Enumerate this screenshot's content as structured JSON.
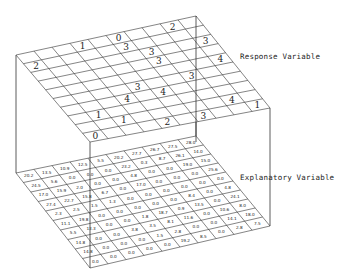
{
  "labels": {
    "response": "Response Variable",
    "explanatory": "Explanatory Variable"
  },
  "colors": {
    "line": "#333333",
    "text": "#222222",
    "background": "#ffffff"
  },
  "top_grid": {
    "rows": 10,
    "cols": 10,
    "cells": [
      {
        "r": 0,
        "c": 3,
        "v": "1"
      },
      {
        "r": 0,
        "c": 8,
        "v": "2"
      },
      {
        "r": 1,
        "c": 0,
        "v": "2"
      },
      {
        "r": 0,
        "c": 5,
        "v": "0"
      },
      {
        "r": 1,
        "c": 5,
        "v": "3"
      },
      {
        "r": 2,
        "c": 6,
        "v": "3"
      },
      {
        "r": 3,
        "c": 6,
        "v": "3"
      },
      {
        "r": 2,
        "c": 9,
        "v": "3"
      },
      {
        "r": 4,
        "c": 9,
        "v": "4"
      },
      {
        "r": 5,
        "c": 7,
        "v": "3"
      },
      {
        "r": 5,
        "c": 4,
        "v": "3"
      },
      {
        "r": 6,
        "c": 5,
        "v": "4"
      },
      {
        "r": 6,
        "c": 3,
        "v": "4"
      },
      {
        "r": 7,
        "c": 1,
        "v": "1"
      },
      {
        "r": 8,
        "c": 2,
        "v": "1"
      },
      {
        "r": 9,
        "c": 4,
        "v": "2"
      },
      {
        "r": 8,
        "c": 8,
        "v": "4"
      },
      {
        "r": 9,
        "c": 6,
        "v": "3"
      },
      {
        "r": 9,
        "c": 0,
        "v": "0"
      },
      {
        "r": 9,
        "c": 9,
        "v": "1"
      }
    ]
  },
  "bottom_grid": {
    "rows": 10,
    "cols": 10,
    "values": [
      [
        "20.2",
        "24.5",
        "17.0",
        "27.4",
        "2.3",
        "11.1",
        "5.5",
        "14.8",
        "14.8",
        "0.0"
      ],
      [
        "13.5",
        "5.6",
        "15.9",
        "22.7",
        "2.5",
        "19.8",
        "13.3",
        "0.0",
        "0.0",
        "0.0"
      ],
      [
        "10.9",
        "0.0",
        "2.0",
        "15.8",
        "1.5",
        "0.0",
        "0.0",
        "0.0",
        "0.0",
        "0.0"
      ],
      [
        "12.5",
        "0.0",
        "0.0",
        "6.7",
        "1.3",
        "0.0",
        "0.0",
        "3.8",
        "0.0",
        "0.0"
      ],
      [
        "5.5",
        "0.0",
        "0.0",
        "0.0",
        "0.0",
        "0.0",
        "1.8",
        "3.5",
        "1.5",
        "0.0"
      ],
      [
        "20.2",
        "23.2",
        "4.8",
        "17.0",
        "0.0",
        "0.0",
        "18.7",
        "8.1",
        "2.8",
        "19.2"
      ],
      [
        "27.7",
        "0.3",
        "0.0",
        "0.0",
        "0.0",
        "0.0",
        "0.9",
        "11.6",
        "0.0",
        "8.5"
      ],
      [
        "26.7",
        "8.7",
        "0.0",
        "0.0",
        "0.0",
        "8.4",
        "13.5",
        "0.0",
        "0.0",
        "0.0"
      ],
      [
        "27.5",
        "26.1",
        "19.0",
        "0.0",
        "0.0",
        "0.0",
        "0.0",
        "10.6",
        "14.1",
        "2.8"
      ],
      [
        "28.0",
        "14.0",
        "15.0",
        "25.6",
        "0.0",
        "4.8",
        "24.1",
        "8.0",
        "18.0",
        "7.5"
      ]
    ]
  }
}
